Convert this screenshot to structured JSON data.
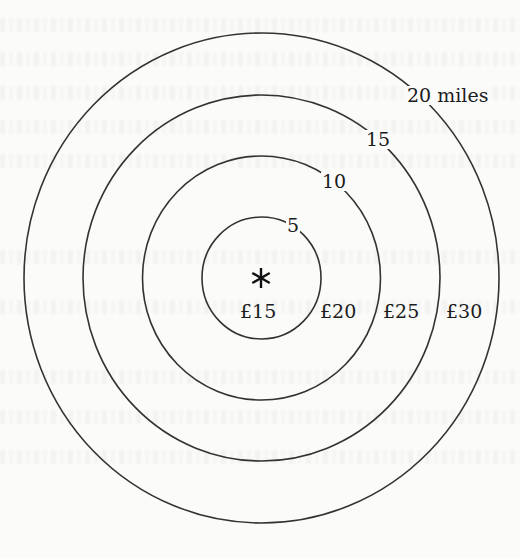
{
  "diagram": {
    "type": "concentric-distance-rings",
    "center_marker": "asterisk-icon",
    "stroke_color": "#333333",
    "text_color": "#1c1c1c",
    "background_color": "#fbfbfa",
    "rings": [
      {
        "radius_miles": 5,
        "label": "5",
        "price_inside": "£15"
      },
      {
        "radius_miles": 10,
        "label": "10",
        "price_inside": "£20"
      },
      {
        "radius_miles": 15,
        "label": "15",
        "price_inside": "£25"
      },
      {
        "radius_miles": 20,
        "label": "20 miles",
        "price_inside": "£30"
      }
    ]
  }
}
